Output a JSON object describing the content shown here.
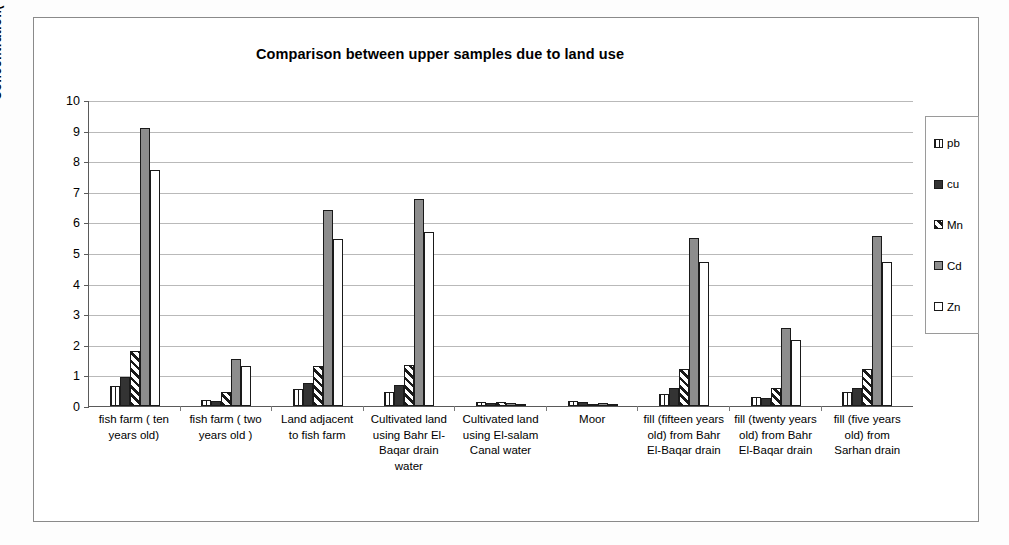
{
  "chart_data": {
    "type": "bar",
    "title": "Comparison between upper samples due to land use",
    "xlabel": "",
    "ylabel": "Concentration( mg/g )",
    "ylim": [
      0,
      10
    ],
    "ytick_labels": [
      "10",
      "9",
      "8",
      "7",
      "6",
      "5",
      "4",
      "3",
      "2",
      "1",
      "0"
    ],
    "grid": true,
    "legend_position": "right",
    "categories": [
      "fish farm ( ten years old)",
      "fish farm ( two years old )",
      "Land adjacent to fish farm",
      "Cultivated land using Bahr El-Baqar drain water",
      "Cultivated land using El-salam Canal water",
      "Moor",
      "fill (fifteen years old) from Bahr El-Baqar drain",
      "fill (twenty years old) from Bahr El-Baqar drain",
      "fill (five years old) from Sarhan drain"
    ],
    "series": [
      {
        "name": "pb",
        "pattern": "vertical-stripes",
        "values": [
          0.65,
          0.2,
          0.55,
          0.45,
          0.12,
          0.18,
          0.4,
          0.3,
          0.45
        ]
      },
      {
        "name": "cu",
        "pattern": "solid-dark",
        "values": [
          0.95,
          0.18,
          0.75,
          0.7,
          0.1,
          0.12,
          0.6,
          0.25,
          0.6
        ]
      },
      {
        "name": "Mn",
        "pattern": "diagonal-stripes",
        "values": [
          1.8,
          0.45,
          1.3,
          1.35,
          0.12,
          0.08,
          1.2,
          0.6,
          1.2
        ]
      },
      {
        "name": "Cd",
        "pattern": "solid-gray",
        "values": [
          9.1,
          1.55,
          6.4,
          6.75,
          0.1,
          0.1,
          5.5,
          2.55,
          5.55
        ]
      },
      {
        "name": "Zn",
        "pattern": "white-outline",
        "values": [
          7.7,
          1.3,
          5.45,
          5.7,
          0.08,
          0.05,
          4.7,
          2.15,
          4.7
        ]
      }
    ]
  },
  "legend": {
    "items": [
      {
        "label": "pb"
      },
      {
        "label": "cu"
      },
      {
        "label": "Mn"
      },
      {
        "label": "Cd"
      },
      {
        "label": "Zn"
      }
    ]
  }
}
